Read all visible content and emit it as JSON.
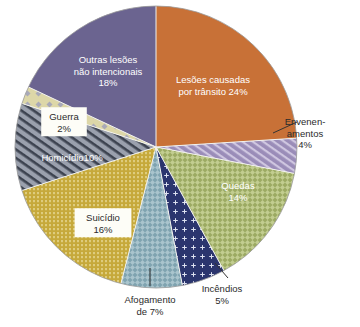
{
  "chart_data": {
    "type": "pie",
    "title": "",
    "subtitle": "",
    "xlabel": "",
    "ylabel": "",
    "legend_position": "none",
    "grid": false,
    "units": "percent",
    "total": 100,
    "start_angle_deg": 0,
    "direction": "clockwise",
    "categories": [
      "Lesões causadas por trânsito",
      "Envenenamentos",
      "Quedas",
      "Incêndios",
      "Afogamento de",
      "Suicídio",
      "Homicídio",
      "Guerra",
      "Outras lesões não intencionais"
    ],
    "values": [
      24,
      4,
      14,
      5,
      7,
      16,
      10,
      2,
      18
    ],
    "slices": [
      {
        "id": "transito",
        "name": "Lesões causadas por trânsito",
        "value": 24,
        "value_label": "24%",
        "label_line1": "Lesões causadas",
        "label_line2": "por trânsito 24%",
        "color": "#c87137",
        "pattern": "solid",
        "label_style": "inside-white",
        "label_x": 213,
        "label_y": 80
      },
      {
        "id": "envenenamentos",
        "name": "Envenenamentos",
        "value": 4,
        "value_label": "4%",
        "label_line1": "Envenen-",
        "label_line2": "amentos",
        "label_line3": "4%",
        "color": "#9a8cb8",
        "pattern": "diagonal",
        "label_style": "callout-right",
        "label_x": 305,
        "label_y": 122
      },
      {
        "id": "quedas",
        "name": "Quedas",
        "value": 14,
        "value_label": "14%",
        "label_line1": "Quedas",
        "label_line2": "14%",
        "color": "#9caa62",
        "pattern": "mesh",
        "label_style": "inside-white",
        "label_x": 238,
        "label_y": 186
      },
      {
        "id": "incendios",
        "name": "Incêndios",
        "value": 5,
        "value_label": "5%",
        "label_line1": "Incêndios",
        "label_line2": "5%",
        "color": "#2b356e",
        "pattern": "cross-dots",
        "label_style": "callout-bottom",
        "label_x": 222,
        "label_y": 289
      },
      {
        "id": "afogamento",
        "name": "Afogamento de",
        "value": 7,
        "value_label": "7%",
        "label_line1": "Afogamento",
        "label_line2": "de 7%",
        "color": "#7fa3b0",
        "pattern": "mesh",
        "label_style": "callout-bottom",
        "label_x": 150,
        "label_y": 300
      },
      {
        "id": "suicidio",
        "name": "Suicídio",
        "value": 16,
        "value_label": "16%",
        "label_line1": "Suicídio",
        "label_line2": "16%",
        "color": "#c6a93b",
        "pattern": "vdots",
        "label_style": "inside-box",
        "label_x": 103,
        "label_y": 218
      },
      {
        "id": "homicidio",
        "name": "Homicídio",
        "value": 10,
        "value_label": "10%",
        "label_line1": "Homicídio10%",
        "color": "#8d94a3",
        "pattern": "diagonal-dark",
        "label_style": "inside-white",
        "label_x": 72,
        "label_y": 158
      },
      {
        "id": "guerra",
        "name": "Guerra",
        "value": 2,
        "value_label": "2%",
        "label_line1": "Guerra",
        "label_line2": "2%",
        "color": "#ddd7a8",
        "pattern": "diamond-dots",
        "label_style": "inside-box",
        "label_x": 64,
        "label_y": 117
      },
      {
        "id": "outras",
        "name": "Outras lesões não intencionais",
        "value": 18,
        "value_label": "18%",
        "label_line1": "Outras lesões",
        "label_line2": "não intencionais",
        "label_line3": "18%",
        "color": "#6b6490",
        "pattern": "solid",
        "label_style": "inside-white",
        "label_x": 108,
        "label_y": 60
      }
    ],
    "geometry": {
      "cx": 156,
      "cy": 147,
      "r": 141
    }
  }
}
